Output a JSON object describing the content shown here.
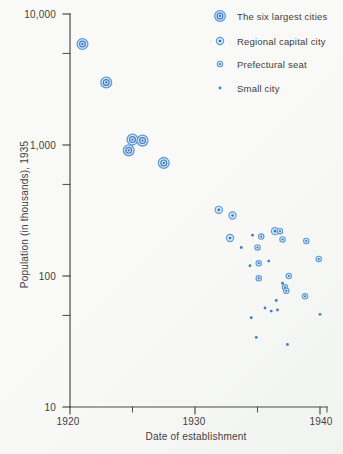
{
  "figure": {
    "background": "#f8f9f7"
  },
  "colors": {
    "marker_stroke": "#5b9bd5",
    "marker_inner_stroke": "#3c7cc6",
    "marker_fill": "#dce8f7",
    "marker_core": "#2e6fbe",
    "small_dot": "#3c7cc6",
    "axis": "#4a4a4a",
    "text": "#3e3e3e"
  },
  "chart_data": {
    "type": "scatter",
    "title": "",
    "xlabel": "Date of establishment",
    "ylabel": "Population (in thousands), 1935",
    "grid": false,
    "legend_position": "top-right",
    "x_axis": {
      "min": 1920,
      "max": 1940.6,
      "major_ticks": [
        1920,
        1930,
        1940
      ],
      "minor_ticks": [
        1925,
        1935
      ],
      "tick_labels": [
        "1920",
        "1930",
        "1940"
      ]
    },
    "y_axis": {
      "scale": "log",
      "min": 10,
      "max": 10000,
      "major_ticks": [
        10000,
        1000,
        100,
        10
      ],
      "minor_ticks": [
        5000,
        500,
        50
      ],
      "tick_labels": [
        "10,000",
        "1,000",
        "100",
        "10"
      ]
    },
    "series": [
      {
        "name": "The six largest cities",
        "marker": "double-ring-large",
        "points": [
          [
            1921.0,
            5900
          ],
          [
            1922.9,
            3000
          ],
          [
            1925.0,
            1100
          ],
          [
            1925.8,
            1080
          ],
          [
            1924.7,
            910
          ],
          [
            1927.5,
            730
          ]
        ]
      },
      {
        "name": "Regional capital city",
        "marker": "ring-medium",
        "points": [
          [
            1931.9,
            320
          ],
          [
            1933.0,
            290
          ],
          [
            1932.8,
            195
          ],
          [
            1936.4,
            220
          ]
        ]
      },
      {
        "name": "Prefectural seat",
        "marker": "ring-small",
        "points": [
          [
            1936.8,
            220
          ],
          [
            1937.0,
            190
          ],
          [
            1938.9,
            185
          ],
          [
            1935.3,
            200
          ],
          [
            1935.0,
            165
          ],
          [
            1935.1,
            125
          ],
          [
            1939.9,
            135
          ],
          [
            1935.1,
            96
          ],
          [
            1937.5,
            100
          ],
          [
            1937.2,
            82
          ],
          [
            1937.3,
            77
          ],
          [
            1938.8,
            70
          ]
        ]
      },
      {
        "name": "Small city",
        "marker": "dot",
        "points": [
          [
            1934.6,
            205
          ],
          [
            1933.7,
            165
          ],
          [
            1934.4,
            120
          ],
          [
            1935.9,
            130
          ],
          [
            1937.0,
            88
          ],
          [
            1936.5,
            65
          ],
          [
            1935.6,
            57
          ],
          [
            1936.1,
            54
          ],
          [
            1936.6,
            55
          ],
          [
            1934.5,
            48
          ],
          [
            1940.0,
            51
          ],
          [
            1934.9,
            34
          ],
          [
            1937.4,
            30
          ]
        ]
      }
    ]
  }
}
